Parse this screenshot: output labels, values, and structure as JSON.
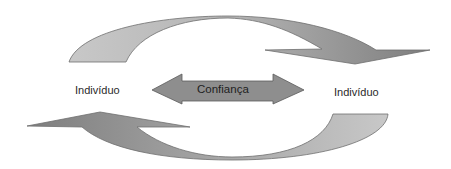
{
  "diagram": {
    "left_node": {
      "label": "Indivíduo"
    },
    "right_node": {
      "label": "Indivíduo"
    },
    "center_link": {
      "label": "Confiança"
    },
    "arrows": [
      {
        "id": "top-arrow",
        "direction": "left-to-right",
        "shape": "curved-arc-over"
      },
      {
        "id": "bottom-arrow",
        "direction": "right-to-left",
        "shape": "curved-arc-under"
      },
      {
        "id": "center-arrow",
        "direction": "bidirectional",
        "shape": "double-headed-block"
      }
    ],
    "colors": {
      "arrow_light": "#c4c4c4",
      "arrow_dark": "#858585",
      "arrow_stroke": "#6e6e6e",
      "center_arrow_fill": "#8e8e8e",
      "text": "#2a2a2a",
      "background": "#ffffff"
    }
  }
}
